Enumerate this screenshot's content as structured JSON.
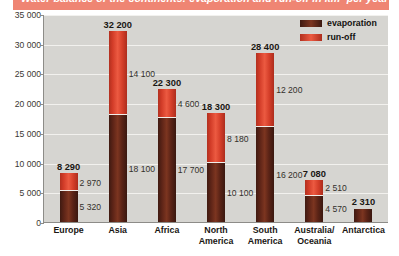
{
  "title": {
    "text": "Water balance of the continents: evaporation and run-off in km³ per year",
    "strip_color": "#ef8573"
  },
  "legend": {
    "position": "top-right",
    "entries": [
      {
        "label": "evaporation",
        "color": "#5e2418",
        "key": "evaporation"
      },
      {
        "label": "run-off",
        "color": "#d94030",
        "key": "runoff"
      }
    ]
  },
  "chart_data": {
    "type": "bar",
    "stacked": true,
    "title": "Water balance of the continents: evaporation and run-off in km³ per year",
    "xlabel": "",
    "ylabel": "",
    "ylim": [
      0,
      35000
    ],
    "ytick_values": [
      0,
      5000,
      10000,
      15000,
      20000,
      25000,
      30000,
      35000
    ],
    "ytick_labels": [
      "0",
      "5 000",
      "10 000",
      "15 000",
      "20 000",
      "25 000",
      "30 000",
      "35 000"
    ],
    "grid": true,
    "legend_position": "top-right",
    "categories": [
      "Europe",
      "Asia",
      "Africa",
      "North America",
      "South America",
      "Australia/ Oceania",
      "Antarctica"
    ],
    "series": [
      {
        "name": "evaporation",
        "color": "#5e2418",
        "values": [
          5320,
          18100,
          17700,
          10100,
          16200,
          4570,
          2310
        ],
        "labels": [
          "5 320",
          "18 100",
          "17 700",
          "10 100",
          "16 200",
          "4 570",
          ""
        ]
      },
      {
        "name": "run-off",
        "color": "#d94030",
        "values": [
          2970,
          14100,
          4600,
          8180,
          12200,
          2510,
          0
        ],
        "labels": [
          "2 970",
          "14 100",
          "4 600",
          "8 180",
          "12 200",
          "2 510",
          ""
        ]
      }
    ],
    "totals": [
      8290,
      32200,
      22300,
      18300,
      28400,
      7080,
      2310
    ],
    "total_labels": [
      "8 290",
      "32 200",
      "22 300",
      "18 300",
      "28 400",
      "7 080",
      "2 310"
    ]
  },
  "bars": [
    {
      "category": "Europe",
      "category_label": "Europe",
      "total_label": "8 290",
      "evaporation_label": "5 320",
      "runoff_label": "2 970"
    },
    {
      "category": "Asia",
      "category_label": "Asia",
      "total_label": "32 200",
      "evaporation_label": "18 100",
      "runoff_label": "14 100"
    },
    {
      "category": "Africa",
      "category_label": "Africa",
      "total_label": "22 300",
      "evaporation_label": "17 700",
      "runoff_label": "4 600"
    },
    {
      "category": "North America",
      "category_label": "North\nAmerica",
      "total_label": "18 300",
      "evaporation_label": "10 100",
      "runoff_label": "8 180"
    },
    {
      "category": "South America",
      "category_label": "South\nAmerica",
      "total_label": "28 400",
      "evaporation_label": "16 200",
      "runoff_label": "12 200"
    },
    {
      "category": "Australia/Oceania",
      "category_label": "Australia/\nOceania",
      "total_label": "7 080",
      "evaporation_label": "4 570",
      "runoff_label": "2 510"
    },
    {
      "category": "Antarctica",
      "category_label": "Antarctica",
      "total_label": "2 310",
      "evaporation_label": "",
      "runoff_label": ""
    }
  ]
}
